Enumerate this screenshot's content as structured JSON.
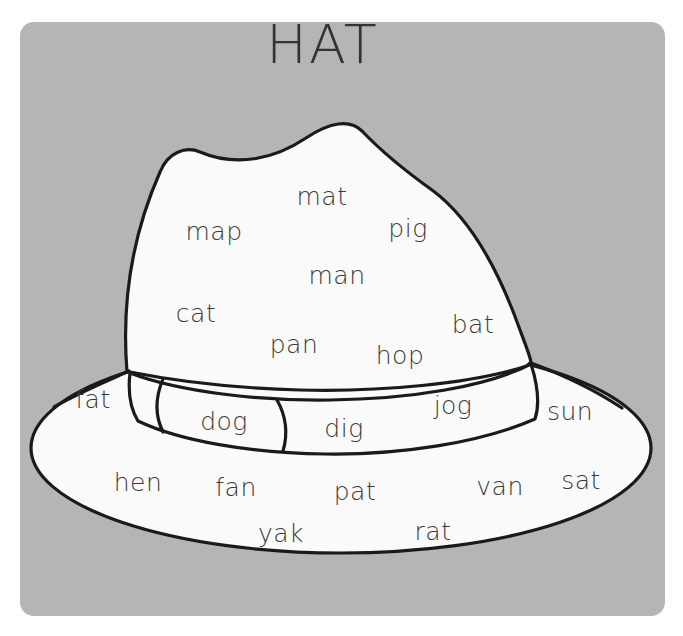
{
  "page": {
    "title": "HAT",
    "background_color": "#ffffff",
    "card_color": "#b5b5b5",
    "hat_fill_color": "#fafafa",
    "hat_outline_color": "#1a1a1a",
    "text_color": "#3a3a3a"
  },
  "illustration": {
    "name": "fedora-hat",
    "parts": [
      "crown",
      "band",
      "band-buckle",
      "brim"
    ]
  },
  "words": [
    {
      "text": "mat",
      "x": 322,
      "y": 196,
      "region": "crown"
    },
    {
      "text": "map",
      "x": 214,
      "y": 231,
      "region": "crown"
    },
    {
      "text": "pig",
      "x": 408,
      "y": 228,
      "region": "crown"
    },
    {
      "text": "man",
      "x": 337,
      "y": 275,
      "region": "crown"
    },
    {
      "text": "cat",
      "x": 196,
      "y": 313,
      "region": "crown"
    },
    {
      "text": "pan",
      "x": 294,
      "y": 344,
      "region": "crown"
    },
    {
      "text": "hop",
      "x": 400,
      "y": 355,
      "region": "crown"
    },
    {
      "text": "bat",
      "x": 473,
      "y": 324,
      "region": "crown"
    },
    {
      "text": "fat",
      "x": 93,
      "y": 399,
      "region": "brim"
    },
    {
      "text": "dog",
      "x": 224,
      "y": 421,
      "region": "band"
    },
    {
      "text": "dig",
      "x": 344,
      "y": 428,
      "region": "band"
    },
    {
      "text": "jog",
      "x": 453,
      "y": 405,
      "region": "band"
    },
    {
      "text": "sun",
      "x": 570,
      "y": 411,
      "region": "brim"
    },
    {
      "text": "hen",
      "x": 138,
      "y": 482,
      "region": "brim"
    },
    {
      "text": "fan",
      "x": 236,
      "y": 487,
      "region": "brim"
    },
    {
      "text": "pat",
      "x": 355,
      "y": 491,
      "region": "brim"
    },
    {
      "text": "van",
      "x": 500,
      "y": 486,
      "region": "brim"
    },
    {
      "text": "sat",
      "x": 581,
      "y": 480,
      "region": "brim"
    },
    {
      "text": "yak",
      "x": 281,
      "y": 533,
      "region": "brim"
    },
    {
      "text": "rat",
      "x": 433,
      "y": 531,
      "region": "brim"
    }
  ]
}
